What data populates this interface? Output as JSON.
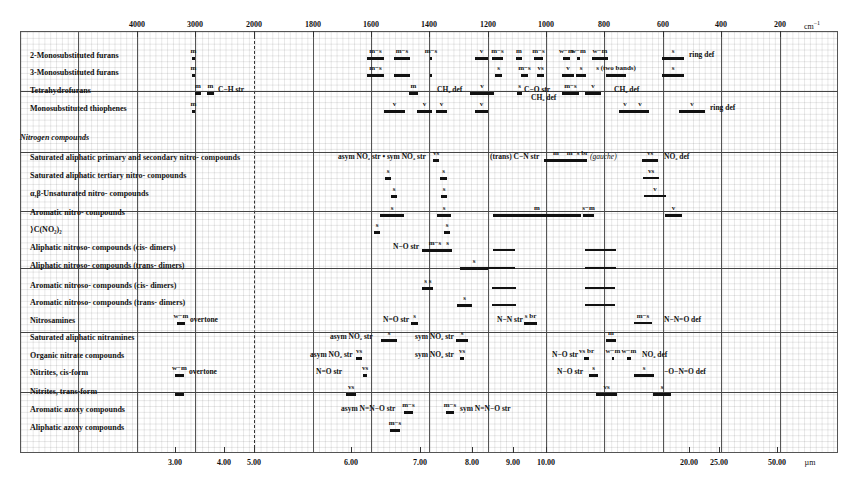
{
  "chart_data": {
    "type": "table",
    "xlabel_top": "cm-1",
    "xlabel_bottom": "µm",
    "top_axis": {
      "unit": "cm⁻¹",
      "ticks": [
        {
          "label": "4000",
          "x": 137
        },
        {
          "label": "3000",
          "x": 195
        },
        {
          "label": "2000",
          "x": 254
        },
        {
          "label": "1800",
          "x": 313
        },
        {
          "label": "1600",
          "x": 371
        },
        {
          "label": "1400",
          "x": 429
        },
        {
          "label": "1200",
          "x": 488
        },
        {
          "label": "1000",
          "x": 546
        },
        {
          "label": "800",
          "x": 604
        },
        {
          "label": "600",
          "x": 663
        },
        {
          "label": "400",
          "x": 721
        },
        {
          "label": "200",
          "x": 780
        }
      ]
    },
    "bottom_axis": {
      "unit": "µm",
      "ticks": [
        {
          "label": "3.00",
          "x": 175
        },
        {
          "label": "4.00",
          "x": 224
        },
        {
          "label": "5.00",
          "x": 254
        },
        {
          "label": "6.00",
          "x": 351
        },
        {
          "label": "7.00",
          "x": 420
        },
        {
          "label": "8.00",
          "x": 472
        },
        {
          "label": "9.00",
          "x": 513
        },
        {
          "label": "10.00",
          "x": 546
        },
        {
          "label": "20.00",
          "x": 689
        },
        {
          "label": "25.00",
          "x": 719
        },
        {
          "label": "50.00",
          "x": 777
        }
      ]
    },
    "major_vlines": [
      78,
      137,
      195,
      313,
      371,
      429,
      488,
      546,
      604,
      663,
      721,
      780
    ],
    "dashed_vline": 254,
    "separators_y": [
      91,
      152,
      211,
      268,
      332,
      392
    ],
    "rows": [
      {
        "label": "2-Monosubstituted furans",
        "y": 55,
        "bands": [
          [
            192,
            195,
            "m"
          ],
          [
            367,
            384,
            "m−s"
          ],
          [
            394,
            410,
            "m−s"
          ],
          [
            430,
            432,
            "m−s"
          ],
          [
            475,
            488,
            "v"
          ],
          [
            492,
            503,
            "m−s"
          ],
          [
            516,
            522,
            "m"
          ],
          [
            534,
            543,
            "m−s"
          ],
          [
            563,
            570,
            "w−m"
          ],
          [
            577,
            580,
            "w−m"
          ],
          [
            592,
            608,
            "w−m"
          ],
          [
            662,
            684,
            "s"
          ]
        ],
        "notes": [
          {
            "x": 689,
            "text": "ring def"
          }
        ]
      },
      {
        "label": "3-Monosubstituted furans",
        "y": 72,
        "bands": [
          [
            192,
            195,
            "m"
          ],
          [
            367,
            384,
            "m−s"
          ],
          [
            394,
            410,
            ""
          ],
          [
            430,
            432,
            ""
          ],
          [
            495,
            502,
            "s"
          ],
          [
            521,
            528,
            "m−s"
          ],
          [
            537,
            544,
            "vs"
          ],
          [
            562,
            574,
            "v"
          ],
          [
            576,
            586,
            "s"
          ],
          [
            606,
            626,
            "s (two bands)"
          ],
          [
            662,
            684,
            "s"
          ]
        ]
      },
      {
        "label": "Tetrahydrofurans",
        "y": 90,
        "bands": [
          [
            195,
            201,
            "m"
          ],
          [
            207,
            214,
            "m"
          ],
          [
            409,
            418,
            "m"
          ],
          [
            470,
            494,
            "v"
          ],
          [
            517,
            522,
            "s"
          ],
          [
            562,
            579,
            "m−s"
          ],
          [
            585,
            601,
            "v"
          ]
        ],
        "notes": [
          {
            "x": 218,
            "text": "C−H str"
          },
          {
            "x": 437,
            "text": "CH₂ def",
            "dy": 0
          },
          {
            "x": 524,
            "text": "C−O str",
            "dy": 0
          },
          {
            "x": 531,
            "text": "CH₂ def",
            "dy": 8
          },
          {
            "x": 614,
            "text": "CH₂ def",
            "dy": 0
          }
        ]
      },
      {
        "label": "Monosubstituted thiophenes",
        "y": 108,
        "bands": [
          [
            192,
            195,
            "m"
          ],
          [
            384,
            405,
            "v"
          ],
          [
            417,
            432,
            "v"
          ],
          [
            436,
            447,
            "v"
          ],
          [
            475,
            488,
            "v"
          ],
          [
            619,
            631,
            "v"
          ],
          [
            631,
            649,
            "v"
          ],
          [
            679,
            705,
            "v"
          ]
        ],
        "notes": [
          {
            "x": 710,
            "text": "ring def"
          }
        ]
      },
      {
        "section": "Nitrogen compounds",
        "y": 137
      },
      {
        "label": "Saturated aliphatic primary and secondary nitro- compounds",
        "y": 157,
        "bands": [
          [
            433,
            439,
            "vs"
          ],
          [
            544,
            568,
            "m"
          ],
          [
            568,
            587,
            "m−s br"
          ],
          [
            642,
            658,
            "vs"
          ]
        ],
        "notes": [
          {
            "x": 338,
            "text": "asym NO₂ str • sym NO₂ str",
            "center": 388
          },
          {
            "x": 490,
            "text": "(trans) C−N str",
            "italic_part": true
          },
          {
            "x": 590,
            "text": "(gauche)",
            "italic": true
          },
          {
            "x": 664,
            "text": "NO₂ def"
          }
        ]
      },
      {
        "label": "Saturated aliphatic tertiary nitro- compounds",
        "y": 175,
        "bands": [
          [
            385,
            391,
            "s"
          ],
          [
            440,
            447,
            "s"
          ],
          [
            643,
            659,
            "vs",
            "thin"
          ]
        ]
      },
      {
        "label": "α,β-Unsaturated nitro- compounds",
        "y": 193,
        "bands": [
          [
            391,
            397,
            "s"
          ],
          [
            441,
            447,
            "s"
          ],
          [
            644,
            666,
            "v",
            "thin"
          ]
        ]
      },
      {
        "label": "Aromatic nitro- compounds",
        "y": 212,
        "bands": [
          [
            380,
            404,
            "s"
          ],
          [
            437,
            451,
            "s"
          ],
          [
            493,
            581,
            "m"
          ],
          [
            583,
            594,
            "s−m"
          ],
          [
            665,
            682,
            "v"
          ]
        ]
      },
      {
        "label": "⟩C(NO₂)₂",
        "y": 229,
        "bands": [
          [
            374,
            380,
            "s"
          ],
          [
            444,
            450,
            "s"
          ]
        ]
      },
      {
        "label": "Aliphatic nitroso- compounds (cis- dimers)",
        "y": 247,
        "bands": [
          [
            422,
            448,
            "m−s"
          ],
          [
            443,
            452,
            "s"
          ],
          [
            493,
            515,
            "",
            "thin"
          ],
          [
            585,
            616,
            "",
            "thin"
          ]
        ],
        "notes": [
          {
            "x": 393,
            "text": "N−O str"
          }
        ]
      },
      {
        "label": "Aliphatic nitroso- compounds (trans- dimers)",
        "y": 265,
        "bands": [
          [
            460,
            488,
            "s"
          ],
          [
            488,
            515,
            "",
            "thin"
          ],
          [
            585,
            616,
            "",
            "thin"
          ]
        ]
      },
      {
        "label": "Aromatic nitroso- compounds (cis- dimers)",
        "y": 285,
        "bands": [
          [
            422,
            429,
            "s"
          ],
          [
            427,
            433,
            "s"
          ],
          [
            492,
            516,
            "",
            "thin"
          ],
          [
            585,
            615,
            "",
            "thin"
          ]
        ]
      },
      {
        "label": "Aromatic nitroso- compounds (trans- dimers)",
        "y": 302,
        "bands": [
          [
            457,
            472,
            "s"
          ],
          [
            492,
            516,
            "",
            "thin"
          ],
          [
            585,
            615,
            "",
            "thin"
          ]
        ]
      },
      {
        "label": "Nitrosamines",
        "y": 320,
        "bands": [
          [
            177,
            185,
            "w−m"
          ],
          [
            411,
            418,
            "s"
          ],
          [
            524,
            537,
            "s br"
          ],
          [
            634,
            652,
            "m−s",
            "thin"
          ]
        ],
        "notes": [
          {
            "x": 190,
            "text": "overtone"
          },
          {
            "x": 383,
            "text": "N=O str"
          },
          {
            "x": 497,
            "text": "N−N str"
          },
          {
            "x": 664,
            "text": "N−N=O def"
          }
        ]
      },
      {
        "label": "Saturated aliphatic nitramines",
        "y": 337,
        "bands": [
          [
            381,
            397,
            "s"
          ],
          [
            456,
            468,
            "s"
          ],
          [
            606,
            616,
            "m"
          ]
        ],
        "notes": [
          {
            "x": 330,
            "text": "asym NO₂ str"
          },
          {
            "x": 415,
            "text": "sym NO₂ str"
          }
        ]
      },
      {
        "label": "Organic nitrate compounds",
        "y": 355,
        "bands": [
          [
            356,
            362,
            "vs"
          ],
          [
            460,
            464,
            "vs"
          ],
          [
            584,
            589,
            "vs br"
          ],
          [
            612,
            614,
            "w−m"
          ],
          [
            627,
            631,
            "w−m"
          ]
        ],
        "notes": [
          {
            "x": 310,
            "text": "asym NO₂ str"
          },
          {
            "x": 415,
            "text": "sym NO₂ str"
          },
          {
            "x": 552,
            "text": "N−O str"
          },
          {
            "x": 642,
            "text": "NO₂ def"
          }
        ]
      },
      {
        "label": "Nitrites, cis-form",
        "y": 372,
        "bands": [
          [
            175,
            184,
            "w−m"
          ],
          [
            363,
            367,
            "vs"
          ],
          [
            589,
            598,
            "s"
          ],
          [
            634,
            654,
            "s"
          ]
        ],
        "notes": [
          {
            "x": 189,
            "text": "overtone"
          },
          {
            "x": 316,
            "text": "N=O str"
          },
          {
            "x": 557,
            "text": "N−O str"
          },
          {
            "x": 664,
            "text": "−O−N=O def"
          }
        ]
      },
      {
        "label": "Nitrites, trans-form",
        "y": 391,
        "bands": [
          [
            175,
            184,
            ""
          ],
          [
            346,
            356,
            "vs"
          ],
          [
            596,
            617,
            "vs"
          ],
          [
            653,
            671,
            "s"
          ]
        ]
      },
      {
        "label": "Aromatic azoxy compounds",
        "y": 409,
        "bands": [
          [
            404,
            413,
            "m−s"
          ],
          [
            446,
            454,
            "m−s"
          ]
        ],
        "notes": [
          {
            "x": 341,
            "text": "asym N=N−O str"
          },
          {
            "x": 460,
            "text": "sym N=N−O str"
          }
        ]
      },
      {
        "label": "Aliphatic azoxy compounds",
        "y": 427,
        "bands": [
          [
            390,
            400,
            "m−s"
          ]
        ]
      }
    ]
  }
}
